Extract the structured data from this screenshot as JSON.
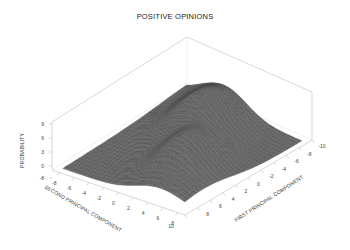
{
  "chart_data": {
    "type": "surface3d",
    "title": "POSITIVE OPINIONS",
    "xlabel": "FIRST PRINCIPAL COMPONENT",
    "ylabel": "SECOND PRINCIPAL COMPONENT",
    "zlabel": "PROBABILITY",
    "x_ticks": [
      "10",
      "8",
      "6",
      "4",
      "2",
      "0",
      "-2",
      "-4",
      "-6",
      "-8",
      "-10"
    ],
    "y_ticks": [
      "-8",
      "-6",
      "-4",
      "-2",
      "0",
      "2",
      "4",
      "6",
      "8"
    ],
    "z_ticks": [
      "-8",
      "0",
      "3",
      "6",
      "9"
    ],
    "xlim": [
      -10,
      10
    ],
    "ylim": [
      -8,
      8
    ],
    "zlim": [
      -8,
      9
    ],
    "grid": false,
    "peaks": [
      {
        "x": 1.0,
        "y": -2.0,
        "height": 7.5,
        "spread": 1.6
      },
      {
        "x": -1.5,
        "y": 1.0,
        "height": 6.5,
        "spread": 1.5
      },
      {
        "x": -3.5,
        "y": 3.0,
        "height": 3.0,
        "spread": 1.8
      },
      {
        "x": 3.0,
        "y": -4.5,
        "height": 2.5,
        "spread": 1.6
      }
    ]
  }
}
